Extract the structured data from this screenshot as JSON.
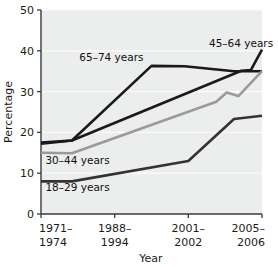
{
  "chart_data": {
    "type": "line",
    "title": "",
    "xlabel": "Year",
    "ylabel": "Percentage",
    "xlim": [
      0,
      3
    ],
    "ylim": [
      0,
      50
    ],
    "yticks": [
      0,
      10,
      20,
      30,
      40,
      50
    ],
    "ytick_labels": [
      "0",
      "10",
      "20",
      "30",
      "40",
      "50"
    ],
    "categories": [
      "1971-\n1974",
      "1988-\n1994",
      "2001-\n2002",
      "2005-\n2006"
    ],
    "xtick_labels_line1": [
      "1971–",
      "1988–",
      "2001–",
      "2005–"
    ],
    "xtick_labels_line2": [
      "1974",
      "1994",
      "2002",
      "2006"
    ],
    "grid": "horizontal",
    "legend_position": "inline-annotations",
    "plot_background": "#eceded",
    "series": [
      {
        "name": "65–74 years",
        "color": "#1a1a1a",
        "label_x": 0.52,
        "label_y": 37.5,
        "x": [
          0,
          0.42,
          1.5,
          1.95,
          2.62,
          3.0
        ],
        "values": [
          17.5,
          18.0,
          36.3,
          36.2,
          35.0,
          35.0
        ]
      },
      {
        "name": "45–64 years",
        "color": "#1a1a1a",
        "label_x": 2.28,
        "label_y": 41.0,
        "x": [
          0,
          0.42,
          2.72,
          2.85,
          3.0
        ],
        "values": [
          17.2,
          18.0,
          35.1,
          35.3,
          40.3
        ]
      },
      {
        "name": "30–44 years",
        "color": "#9a9a9a",
        "label_x": 0.06,
        "label_y": 12.2,
        "x": [
          0,
          0.42,
          2.38,
          2.52,
          2.68,
          3.0
        ],
        "values": [
          15.0,
          14.9,
          27.5,
          29.8,
          28.9,
          35.0
        ]
      },
      {
        "name": "18–29 years",
        "color": "#333333",
        "label_x": 0.06,
        "label_y": 5.6,
        "x": [
          0,
          0.42,
          2.0,
          2.62,
          3.0
        ],
        "values": [
          8.0,
          8.0,
          13.0,
          23.3,
          24.1
        ]
      }
    ]
  }
}
